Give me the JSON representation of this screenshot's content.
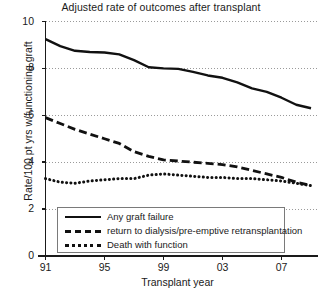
{
  "chart_data": {
    "type": "line",
    "title": "Adjusted rate of outcomes after transplant",
    "xlabel": "Transplant year",
    "ylabel": "Rate/100 pt yrs w/functioning graft",
    "grid": true,
    "legend_position": "bottom-center",
    "xlim": [
      1991,
      2009
    ],
    "ylim": [
      0,
      10
    ],
    "yticks": [
      "0",
      "2",
      "4",
      "6",
      "8",
      "10"
    ],
    "ytick_values": [
      0,
      2,
      4,
      6,
      8,
      10
    ],
    "xticks": [
      "91",
      "95",
      "99",
      "03",
      "07"
    ],
    "xtick_values": [
      1991,
      1995,
      1999,
      2003,
      2007
    ],
    "x": [
      1991,
      1992,
      1993,
      1994,
      1995,
      1996,
      1997,
      1998,
      1999,
      2000,
      2001,
      2002,
      2003,
      2004,
      2005,
      2006,
      2007,
      2008,
      2009
    ],
    "series": [
      {
        "name": "Any graft failure",
        "style": "solid",
        "color": "#111111",
        "values": [
          9.25,
          8.95,
          8.75,
          8.7,
          8.68,
          8.6,
          8.35,
          8.05,
          8.0,
          7.98,
          7.85,
          7.7,
          7.6,
          7.4,
          7.15,
          7.0,
          6.75,
          6.45,
          6.3
        ]
      },
      {
        "name": "return to dialysis/pre-emptive retransplantation",
        "style": "dashed",
        "color": "#111111",
        "values": [
          5.9,
          5.65,
          5.4,
          5.2,
          5.0,
          4.8,
          4.45,
          4.25,
          4.1,
          4.05,
          4.0,
          3.95,
          3.9,
          3.8,
          3.65,
          3.5,
          3.35,
          3.15,
          3.0
        ]
      },
      {
        "name": "Death with function",
        "style": "dotted",
        "color": "#111111",
        "values": [
          3.3,
          3.15,
          3.1,
          3.2,
          3.25,
          3.3,
          3.3,
          3.45,
          3.5,
          3.45,
          3.4,
          3.35,
          3.35,
          3.3,
          3.3,
          3.25,
          3.2,
          3.1,
          3.0
        ]
      }
    ]
  }
}
